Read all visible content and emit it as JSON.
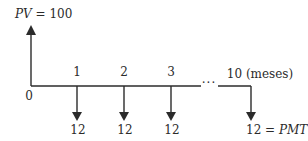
{
  "diagram": {
    "type": "cash-flow-timeline",
    "present_value": {
      "symbol": "PV",
      "equals": "=",
      "value": "100"
    },
    "period_zero_label": "0",
    "periods": [
      {
        "label": "1",
        "payment": "12"
      },
      {
        "label": "2",
        "payment": "12"
      },
      {
        "label": "3",
        "payment": "12"
      }
    ],
    "ellipsis": "···",
    "last_period": {
      "label": "10 (meses)",
      "payment": "12",
      "equals": "=",
      "payment_symbol": "PMT"
    },
    "colors": {
      "line": "#2b2b2b",
      "text": "#2b2b2b",
      "background": "#ffffff"
    }
  }
}
